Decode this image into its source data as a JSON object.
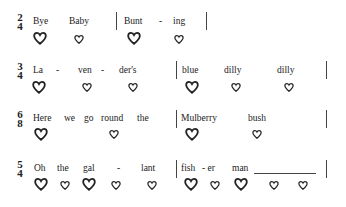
{
  "rows": [
    {
      "time_signature": {
        "top": "2",
        "bottom": "4"
      },
      "lyrics": [
        "Bye",
        "Baby",
        "Bunt",
        "-",
        "ing"
      ],
      "hearts": [
        "large",
        "small",
        "large",
        "small"
      ]
    },
    {
      "time_signature": {
        "top": "3",
        "bottom": "4"
      },
      "lyrics": [
        "La",
        "-",
        "ven",
        "-",
        "der's",
        "blue",
        "dilly",
        "dilly"
      ],
      "hearts": [
        "large",
        "small",
        "small",
        "large",
        "small",
        "small"
      ]
    },
    {
      "time_signature": {
        "top": "6",
        "bottom": "8"
      },
      "lyrics": [
        "Here",
        "we",
        "go",
        "round",
        "the",
        "Mulberry",
        "bush"
      ],
      "hearts": [
        "large",
        "small",
        "large",
        "small"
      ]
    },
    {
      "time_signature": {
        "top": "5",
        "bottom": "4"
      },
      "lyrics": [
        "Oh",
        "the",
        "gal",
        "-",
        "lant",
        "fish",
        "- er",
        "man"
      ],
      "hearts": [
        "large",
        "small",
        "large",
        "small",
        "small",
        "large",
        "small",
        "large",
        "small",
        "small"
      ]
    }
  ]
}
